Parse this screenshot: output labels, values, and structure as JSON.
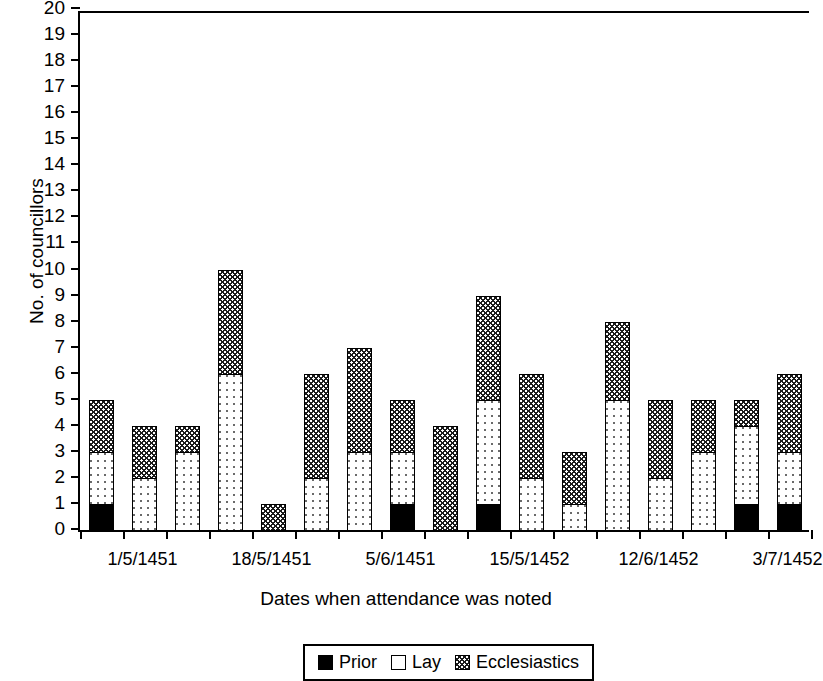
{
  "chart_data": {
    "type": "bar",
    "subtype": "stacked-bar",
    "title": "",
    "xlabel": "Dates when attendance was noted",
    "ylabel": "No. of councillors",
    "ylim": [
      0,
      20
    ],
    "ytick_step": 1,
    "grid": false,
    "legend_position": "bottom",
    "categories": [
      "1",
      "2",
      "3",
      "4",
      "5",
      "6",
      "7",
      "8",
      "9",
      "10",
      "11",
      "12",
      "13",
      "14",
      "15",
      "16",
      "17"
    ],
    "x_tick_labels": [
      "1/5/1451",
      "18/5/1451",
      "5/6/1451",
      "15/5/1452",
      "12/6/1452",
      "3/7/1452"
    ],
    "x_tick_label_positions": [
      1,
      4,
      7,
      10,
      13,
      16
    ],
    "y_tick_labels": [
      "0",
      "1",
      "2",
      "3",
      "4",
      "5",
      "6",
      "7",
      "8",
      "9",
      "10",
      "11",
      "12",
      "13",
      "14",
      "15",
      "16",
      "17",
      "18",
      "19",
      "20"
    ],
    "series": [
      {
        "name": "Prior",
        "color": "#000000",
        "pattern": "solid",
        "values": [
          1,
          0,
          0,
          0,
          0,
          0,
          0,
          1,
          0,
          1,
          0,
          0,
          0,
          0,
          0,
          1,
          1
        ]
      },
      {
        "name": "Lay",
        "color": "#ffffff",
        "pattern": "sparse-dots",
        "values": [
          2,
          2,
          3,
          6,
          0,
          2,
          3,
          2,
          0,
          4,
          2,
          1,
          5,
          2,
          3,
          3,
          2
        ]
      },
      {
        "name": "Ecclesiastics",
        "color": "#1a1a1a",
        "pattern": "dense-checker",
        "values": [
          2,
          2,
          1,
          4,
          1,
          4,
          4,
          2,
          4,
          4,
          4,
          2,
          3,
          3,
          2,
          1,
          3
        ]
      }
    ],
    "totals": [
      5,
      4,
      4,
      10,
      1,
      6,
      7,
      5,
      4,
      9,
      6,
      3,
      8,
      5,
      5,
      5,
      6
    ]
  },
  "legend": {
    "entries": [
      {
        "label": "Prior",
        "swatch": "prior-swatch"
      },
      {
        "label": "Lay",
        "swatch": "lay-swatch"
      },
      {
        "label": "Ecclesiastics",
        "swatch": "ecclesiastics-swatch"
      }
    ]
  }
}
